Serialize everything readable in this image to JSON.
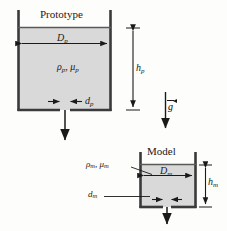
{
  "figure": {
    "background_color": "#fdfdfb",
    "ink_color": "#1a1a1a",
    "fluid_fill_color": "#d9d9d9",
    "wall_color": "#3a3a3a"
  },
  "prototype": {
    "title": "Prototype",
    "diameter_label": "D",
    "diameter_sub": "p",
    "height_label": "h",
    "height_sub": "p",
    "orifice_label": "d",
    "orifice_sub": "p",
    "fluid_density_label": "ρ",
    "fluid_density_sub": "p",
    "fluid_viscosity_label": "μ",
    "fluid_viscosity_sub": "p",
    "fluid_props_separator": ", "
  },
  "model": {
    "title": "Model",
    "diameter_label": "D",
    "diameter_sub": "m",
    "height_label": "h",
    "height_sub": "m",
    "orifice_label": "d",
    "orifice_sub": "m",
    "fluid_density_label": "ρ",
    "fluid_density_sub": "m",
    "fluid_viscosity_label": "μ",
    "fluid_viscosity_sub": "m",
    "fluid_props_separator": ", "
  },
  "gravity": {
    "symbol": "g",
    "vector_notation": "arrow-over",
    "direction": "down"
  }
}
